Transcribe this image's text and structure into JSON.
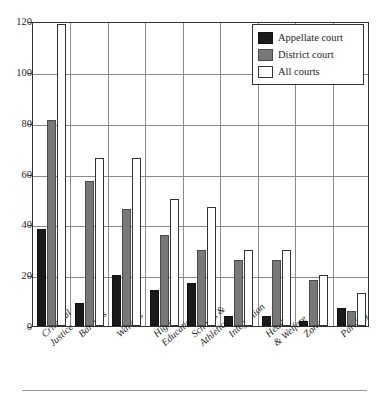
{
  "chart_data": {
    "type": "bar",
    "title": "",
    "subtitle": "",
    "xlabel": "",
    "ylabel": "",
    "ylim": [
      0,
      120
    ],
    "yticks": [
      0,
      20,
      40,
      60,
      80,
      100,
      120
    ],
    "grid": true,
    "legend_position": "top-right",
    "categories": [
      "Criminal Justice",
      "Barriers",
      "Waivers",
      "Higher Education",
      "Schools & Athletic",
      "Integration",
      "Health & Welfare",
      "Zoning",
      "Parking"
    ],
    "category_lines": [
      [
        "Criminal",
        "Justice"
      ],
      [
        "Barriers"
      ],
      [
        "Waivers"
      ],
      [
        "Higher",
        "Education"
      ],
      [
        "Schools &",
        "Athletic"
      ],
      [
        "Integration"
      ],
      [
        "Health",
        "& Welfare"
      ],
      [
        "Zoning"
      ],
      [
        "Parking"
      ]
    ],
    "series": [
      {
        "name": "Appellate court",
        "color": "#1a1a1a",
        "values": [
          38,
          9,
          20,
          14,
          17,
          4,
          4,
          2,
          7
        ]
      },
      {
        "name": "District court",
        "color": "#787878",
        "values": [
          81,
          57,
          46,
          36,
          30,
          26,
          26,
          18,
          6
        ]
      },
      {
        "name": "All courts",
        "color": "#ffffff",
        "values": [
          119,
          66,
          66,
          50,
          47,
          30,
          30,
          20,
          13
        ]
      }
    ]
  },
  "legend": {
    "items": [
      {
        "label": "Appellate court",
        "swatch": "appellate"
      },
      {
        "label": "District court",
        "swatch": "district"
      },
      {
        "label": "All courts",
        "swatch": "all"
      }
    ]
  },
  "colors": {
    "appellate": "#1a1a1a",
    "district": "#787878",
    "all": "#ffffff",
    "axis": "#333333",
    "grid": "#8a8a8a"
  }
}
